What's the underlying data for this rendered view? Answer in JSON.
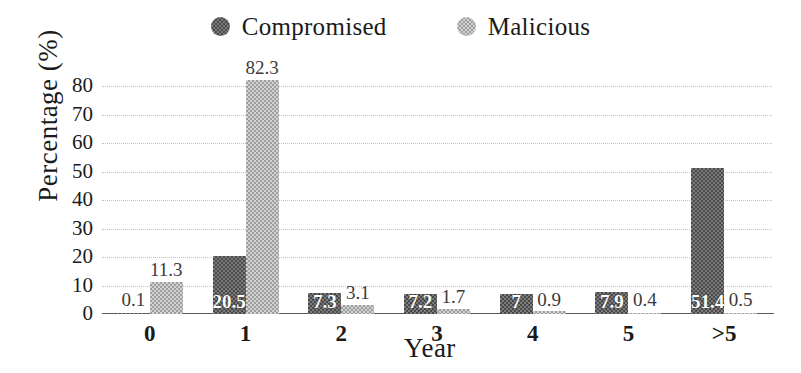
{
  "chart_data": {
    "type": "bar",
    "title": "",
    "xlabel": "Year",
    "ylabel": "Percentage (%)",
    "categories": [
      "0",
      "1",
      "2",
      "3",
      "4",
      "5",
      ">5"
    ],
    "ylim": [
      0,
      85
    ],
    "yticks": [
      "0",
      "10",
      "20",
      "30",
      "40",
      "50",
      "60",
      "70",
      "80"
    ],
    "grid": true,
    "legend_position": "top-center",
    "series": [
      {
        "name": "Compromised",
        "color": "#5c5c5c",
        "values": [
          0.1,
          20.5,
          7.3,
          7.2,
          7,
          7.9,
          51.4
        ],
        "labels": [
          "0.1",
          "20.5",
          "7.3",
          "7.2",
          "7",
          "7.9",
          "51.4"
        ]
      },
      {
        "name": "Malicious",
        "color": "#bdbdbd",
        "values": [
          11.3,
          82.3,
          3.1,
          1.7,
          0.9,
          0.4,
          0.5
        ],
        "labels": [
          "11.3",
          "82.3",
          "3.1",
          "1.7",
          "0.9",
          "0.4",
          "0.5"
        ]
      }
    ]
  },
  "legend": {
    "items": [
      {
        "label": "Compromised",
        "marker": "filled-circle-dark"
      },
      {
        "label": "Malicious",
        "marker": "filled-circle-light"
      }
    ]
  }
}
